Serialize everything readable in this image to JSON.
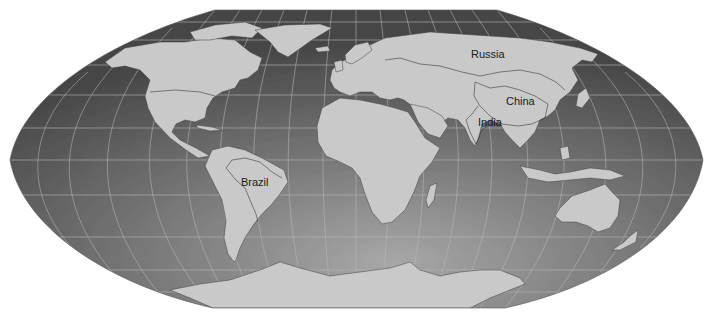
{
  "map": {
    "projection_style": "flat-polar pseudo-cylindrical world map",
    "colors": {
      "background": "#ffffff",
      "ocean_light": "#a4a4a4",
      "ocean_dark": "#474747",
      "land": "#c9c9c9",
      "border": "#3a3a3a",
      "graticule": "#b8b8b8",
      "label": "#1a1a1a"
    },
    "labels": [
      {
        "id": "russia",
        "text": "Russia",
        "x": 471,
        "y": 58
      },
      {
        "id": "china",
        "text": "China",
        "x": 506,
        "y": 105
      },
      {
        "id": "india",
        "text": "India",
        "x": 478,
        "y": 125
      },
      {
        "id": "brazil",
        "text": "Brazil",
        "x": 241,
        "y": 186
      }
    ]
  }
}
